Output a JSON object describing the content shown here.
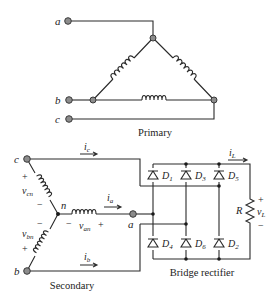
{
  "figure": {
    "primary": {
      "caption": "Primary",
      "configuration": "delta",
      "terminals": [
        "a",
        "b",
        "c"
      ]
    },
    "secondary": {
      "caption": "Secondary",
      "configuration": "wye",
      "neutral_label": "n",
      "terminals": [
        "c",
        "a",
        "b"
      ],
      "voltages": {
        "v_cn": {
          "base": "v",
          "sub": "cn",
          "plus": "+",
          "minus": "−"
        },
        "v_an": {
          "base": "v",
          "sub": "an",
          "plus": "+",
          "minus": "−"
        },
        "v_bn": {
          "base": "v",
          "sub": "bn",
          "plus": "+",
          "minus": "−"
        }
      },
      "currents": {
        "i_c": {
          "base": "i",
          "sub": "c"
        },
        "i_a": {
          "base": "i",
          "sub": "a"
        },
        "i_b": {
          "base": "i",
          "sub": "b"
        }
      }
    },
    "rectifier": {
      "caption": "Bridge rectifier",
      "diodes_top": [
        {
          "base": "D",
          "sub": "1"
        },
        {
          "base": "D",
          "sub": "3"
        },
        {
          "base": "D",
          "sub": "5"
        }
      ],
      "diodes_bottom": [
        {
          "base": "D",
          "sub": "4"
        },
        {
          "base": "D",
          "sub": "6"
        },
        {
          "base": "D",
          "sub": "2"
        }
      ],
      "load": {
        "resistor_label": "R",
        "current": {
          "base": "i",
          "sub": "L"
        },
        "voltage": {
          "base": "v",
          "sub": "L",
          "plus": "+",
          "minus": "−"
        }
      }
    }
  },
  "colors": {
    "wire": "#2a2a2a",
    "terminal_fill": "#8c8c8c",
    "background": "#ffffff"
  }
}
